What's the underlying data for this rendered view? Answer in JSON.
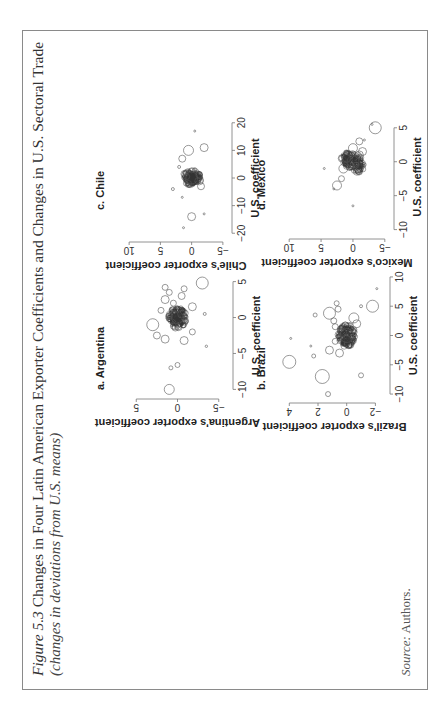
{
  "figure": {
    "label": "Figure 5.3",
    "title": "Changes in Four Latin American Exporter Coefficients and Changes in U.S. Sectoral Trade",
    "subtitle": "(changes in deviations from U.S. means)",
    "source_label": "Source:",
    "source_text": "Authors.",
    "orientation": "rotated 90° counterclockwise on page"
  },
  "chart_data": [
    {
      "type": "scatter",
      "panel": "a",
      "title": "a. Argentina",
      "xlabel": "U.S. coefficient",
      "ylabel": "Argentina's exporter coefficient",
      "xticks": [
        -10,
        -5,
        0,
        5
      ],
      "yticks": [
        -5,
        0,
        5
      ],
      "xlim": [
        -10.5,
        5.5
      ],
      "ylim": [
        -6,
        6
      ],
      "marker": "hollow circles sized by weight",
      "points": [
        {
          "x": -10,
          "y": 1,
          "r": 5
        },
        {
          "x": -7,
          "y": 0.8,
          "r": 2
        },
        {
          "x": -6.6,
          "y": 0,
          "r": 2.5
        },
        {
          "x": -4,
          "y": -3.5,
          "r": 1.2
        },
        {
          "x": -3,
          "y": 1.5,
          "r": 4
        },
        {
          "x": -3.2,
          "y": -0.8,
          "r": 4
        },
        {
          "x": -2.5,
          "y": 2.5,
          "r": 3.5
        },
        {
          "x": -2,
          "y": -1.8,
          "r": 3
        },
        {
          "x": -1,
          "y": 3,
          "r": 6
        },
        {
          "x": -1.2,
          "y": 0.5,
          "r": 3
        },
        {
          "x": -0.5,
          "y": -1,
          "r": 2.5
        },
        {
          "x": 0,
          "y": 0,
          "r": 6
        },
        {
          "x": 0.2,
          "y": 1,
          "r": 3
        },
        {
          "x": 0.5,
          "y": -0.5,
          "r": 4
        },
        {
          "x": 0.5,
          "y": -3.3,
          "r": 1.5
        },
        {
          "x": 1,
          "y": 2,
          "r": 3
        },
        {
          "x": 1.5,
          "y": -1.8,
          "r": 4
        },
        {
          "x": 2,
          "y": 0.5,
          "r": 3
        },
        {
          "x": 2.5,
          "y": 1.5,
          "r": 4
        },
        {
          "x": 3,
          "y": -0.5,
          "r": 3.5
        },
        {
          "x": 3.5,
          "y": 1,
          "r": 3
        },
        {
          "x": 4,
          "y": -0.8,
          "r": 3
        },
        {
          "x": 4.2,
          "y": 1.5,
          "r": 3
        },
        {
          "x": 4.8,
          "y": -3,
          "r": 6
        }
      ]
    },
    {
      "type": "scatter",
      "panel": "b",
      "title": "b. Brazil",
      "xlabel": "U.S. coefficient",
      "ylabel": "Brazil's exporter coefficient",
      "xticks": [
        -10,
        -5,
        0,
        5,
        10
      ],
      "yticks": [
        -2,
        0,
        2,
        4
      ],
      "xlim": [
        -10.5,
        10.5
      ],
      "ylim": [
        -2.6,
        4.3
      ],
      "marker": "hollow circles sized by weight",
      "points": [
        {
          "x": -10,
          "y": 1.3,
          "r": 2.5
        },
        {
          "x": -7,
          "y": 1.7,
          "r": 7
        },
        {
          "x": -6.8,
          "y": -1,
          "r": 2.5
        },
        {
          "x": -4.5,
          "y": 4,
          "r": 6.5
        },
        {
          "x": -3.5,
          "y": 2.3,
          "r": 2
        },
        {
          "x": -3,
          "y": 0.5,
          "r": 4
        },
        {
          "x": -2.5,
          "y": 1.2,
          "r": 4
        },
        {
          "x": -1.8,
          "y": 2.5,
          "r": 1
        },
        {
          "x": -1,
          "y": 0.8,
          "r": 3
        },
        {
          "x": -0.5,
          "y": 3.9,
          "r": 1
        },
        {
          "x": 0,
          "y": 0,
          "r": 7
        },
        {
          "x": 0.5,
          "y": 0.3,
          "r": 4
        },
        {
          "x": 1,
          "y": -0.5,
          "r": 3
        },
        {
          "x": 1.5,
          "y": 0.8,
          "r": 3
        },
        {
          "x": 2,
          "y": -0.7,
          "r": 4
        },
        {
          "x": 2.5,
          "y": 0.9,
          "r": 3
        },
        {
          "x": 3,
          "y": -0.5,
          "r": 5
        },
        {
          "x": 3.5,
          "y": 2.2,
          "r": 2
        },
        {
          "x": 3.8,
          "y": 1.2,
          "r": 6
        },
        {
          "x": 4.5,
          "y": 0.6,
          "r": 3
        },
        {
          "x": 5,
          "y": -1.8,
          "r": 6
        },
        {
          "x": 5.5,
          "y": 0.7,
          "r": 2.5
        },
        {
          "x": 5,
          "y": -1,
          "r": 1.5
        },
        {
          "x": 8,
          "y": -2.1,
          "r": 1
        }
      ]
    },
    {
      "type": "scatter",
      "panel": "c",
      "title": "c. Chile",
      "xlabel": "U.S. coefficient",
      "ylabel": "Chile's exporter coefficient",
      "xticks": [
        -20,
        -10,
        0,
        10,
        20
      ],
      "yticks": [
        -5,
        0,
        5,
        10
      ],
      "xlim": [
        -21,
        21
      ],
      "ylim": [
        -5.5,
        10.5
      ],
      "marker": "hollow circles sized by weight",
      "points": [
        {
          "x": -18,
          "y": 1.3,
          "r": 1
        },
        {
          "x": -14,
          "y": 0,
          "r": 4
        },
        {
          "x": -13,
          "y": -2,
          "r": 1
        },
        {
          "x": -7,
          "y": 1.5,
          "r": 1
        },
        {
          "x": -4,
          "y": 3,
          "r": 1.5
        },
        {
          "x": -3,
          "y": -1.5,
          "r": 3.5
        },
        {
          "x": -2,
          "y": 0.5,
          "r": 3
        },
        {
          "x": -1,
          "y": -1,
          "r": 3
        },
        {
          "x": 0,
          "y": 0,
          "r": 6
        },
        {
          "x": 0.5,
          "y": 0.8,
          "r": 3
        },
        {
          "x": 1,
          "y": -1.2,
          "r": 3
        },
        {
          "x": 2,
          "y": 1,
          "r": 2.5
        },
        {
          "x": 3,
          "y": -0.5,
          "r": 2
        },
        {
          "x": 4,
          "y": 2,
          "r": 1.5
        },
        {
          "x": 7,
          "y": 1.5,
          "r": 3.5
        },
        {
          "x": 10,
          "y": 0.5,
          "r": 5
        },
        {
          "x": 11,
          "y": -2,
          "r": 4
        },
        {
          "x": 17,
          "y": -0.5,
          "r": 1
        }
      ]
    },
    {
      "type": "scatter",
      "panel": "d",
      "title": "d. Mexico",
      "xlabel": "U.S. coefficient",
      "ylabel": "Mexico's exporter coefficient",
      "xticks": [
        -10,
        -5,
        0,
        5
      ],
      "yticks": [
        -5,
        0,
        5,
        10
      ],
      "xlim": [
        -10.5,
        6
      ],
      "ylim": [
        -5.5,
        10.5
      ],
      "marker": "hollow circles sized by weight",
      "points": [
        {
          "x": -6.5,
          "y": 0,
          "r": 1
        },
        {
          "x": -4,
          "y": 3,
          "r": 1
        },
        {
          "x": -3.5,
          "y": 2.5,
          "r": 4.5
        },
        {
          "x": -2.5,
          "y": 1.8,
          "r": 3
        },
        {
          "x": -1,
          "y": 4.5,
          "r": 1
        },
        {
          "x": -1,
          "y": 1.5,
          "r": 4.5
        },
        {
          "x": -0.5,
          "y": -0.5,
          "r": 3
        },
        {
          "x": 0,
          "y": 0,
          "r": 6
        },
        {
          "x": 0.5,
          "y": 1,
          "r": 4
        },
        {
          "x": 1,
          "y": -1,
          "r": 4
        },
        {
          "x": 1.5,
          "y": -1.5,
          "r": 4
        },
        {
          "x": 2,
          "y": 0,
          "r": 4.5
        },
        {
          "x": 3,
          "y": -1,
          "r": 3.5
        },
        {
          "x": 3.2,
          "y": -1.8,
          "r": 1
        },
        {
          "x": 5,
          "y": -3.5,
          "r": 6
        },
        {
          "x": 5.5,
          "y": -3,
          "r": 1
        }
      ]
    }
  ]
}
